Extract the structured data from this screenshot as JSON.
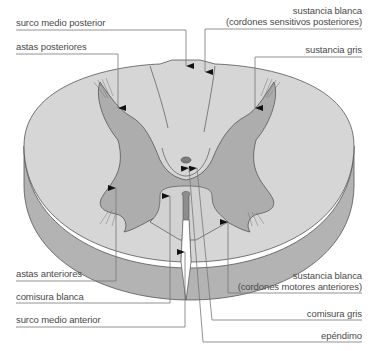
{
  "diagram": {
    "type": "anatomical cross-section",
    "colors": {
      "white_matter": "#d4d4d4",
      "white_matter_side": "#b0b0b0",
      "grey_matter": "#ababab",
      "outline": "#555555",
      "leader_line": "#777777",
      "label_text": "#4a4a4a"
    },
    "labels_left": [
      {
        "id": "surco-medio-posterior",
        "text": "surco medio posterior"
      },
      {
        "id": "astas-posteriores",
        "text": "astas posteriores"
      },
      {
        "id": "astas-anteriores",
        "text": "astas anteriores"
      },
      {
        "id": "comisura-blanca",
        "text": "comisura blanca"
      },
      {
        "id": "surco-medio-anterior",
        "text": "surco medio anterior"
      }
    ],
    "labels_right": [
      {
        "id": "sustancia-blanca-posterior",
        "line1": "sustancia blanca",
        "line2": "(cordones sensitivos posteriores)"
      },
      {
        "id": "sustancia-gris-top",
        "text": "sustancia gris"
      },
      {
        "id": "sustancia-blanca-anterior",
        "line1": "sustancia blanca",
        "line2": "(cordones motores anteriores)"
      },
      {
        "id": "comisura-gris",
        "text": "comisura gris"
      },
      {
        "id": "ependimo",
        "text": "epéndimo"
      }
    ]
  }
}
